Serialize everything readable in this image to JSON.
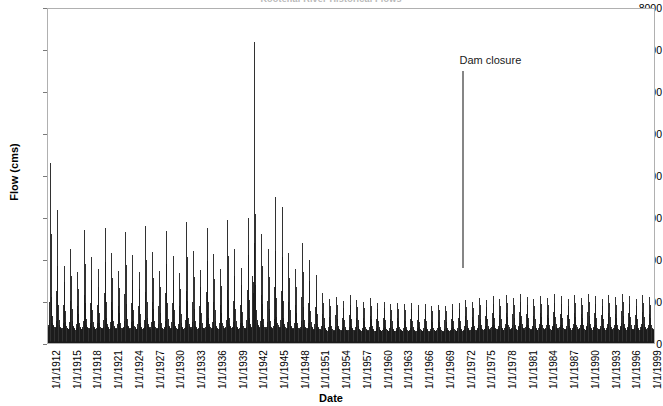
{
  "chart_data": {
    "type": "bar",
    "title": "Kootenai River Historical Flows",
    "xlabel": "Date",
    "ylabel": "Flow (cms)",
    "ylim": [
      0,
      8000
    ],
    "ytick_values": [
      0,
      1000,
      2000,
      3000,
      4000,
      5000,
      6000,
      7000,
      8000
    ],
    "ytick_labels": [
      "0",
      "1000",
      "2000",
      "3000",
      "4000",
      "5000",
      "6000",
      "7000",
      "8000"
    ],
    "grid": false,
    "legend": false,
    "xtick_labels": [
      "1/1/1912",
      "1/1/1915",
      "1/1/1918",
      "1/1/1921",
      "1/1/1924",
      "1/1/1927",
      "1/1/1930",
      "1/1/1933",
      "1/1/1936",
      "1/1/1939",
      "1/1/1942",
      "1/1/1945",
      "1/1/1948",
      "1/1/1951",
      "1/1/1954",
      "1/1/1957",
      "1/1/1960",
      "1/1/1963",
      "1/1/1966",
      "1/1/1969",
      "1/1/1972",
      "1/1/1975",
      "1/1/1978",
      "1/1/1981",
      "1/1/1984",
      "1/1/1987",
      "1/1/1990",
      "1/1/1993",
      "1/1/1996",
      "1/1/1999"
    ],
    "x_start_year": 1912,
    "x_end_year": 2000,
    "series_name": "Flow",
    "series_color": "#1a1a1a",
    "annotations": [
      {
        "name": "dam-closure",
        "text": "Dam closure",
        "year": 1972.0,
        "value_top": 6500,
        "value_bottom": 1800,
        "color": "#868686"
      }
    ],
    "monthly_values": [
      380,
      420,
      560,
      980,
      4300,
      2600,
      1100,
      640,
      470,
      420,
      400,
      380,
      350,
      380,
      520,
      1250,
      3180,
      1850,
      900,
      560,
      430,
      390,
      370,
      350,
      330,
      360,
      480,
      900,
      1850,
      1450,
      760,
      500,
      400,
      370,
      350,
      340,
      340,
      370,
      500,
      1000,
      2250,
      1600,
      820,
      520,
      410,
      380,
      360,
      345,
      320,
      350,
      460,
      880,
      1700,
      1300,
      700,
      470,
      390,
      360,
      345,
      330,
      345,
      375,
      520,
      1150,
      2700,
      1900,
      950,
      580,
      440,
      395,
      370,
      355,
      335,
      365,
      490,
      950,
      2050,
      1500,
      780,
      510,
      405,
      375,
      355,
      340,
      330,
      355,
      470,
      900,
      1780,
      1350,
      720,
      480,
      395,
      365,
      350,
      335,
      350,
      380,
      540,
      1200,
      2750,
      1950,
      980,
      590,
      445,
      400,
      375,
      360,
      340,
      370,
      500,
      980,
      2150,
      1550,
      800,
      520,
      410,
      380,
      358,
      342,
      325,
      352,
      465,
      890,
      1720,
      1320,
      710,
      475,
      392,
      362,
      348,
      332,
      348,
      378,
      530,
      1180,
      2650,
      1880,
      940,
      575,
      438,
      396,
      372,
      356,
      338,
      368,
      495,
      960,
      2100,
      1520,
      790,
      515,
      408,
      378,
      356,
      340,
      328,
      350,
      462,
      885,
      1690,
      1300,
      705,
      472,
      390,
      360,
      346,
      330,
      352,
      382,
      545,
      1220,
      2800,
      2000,
      990,
      595,
      448,
      402,
      377,
      361,
      342,
      372,
      502,
      985,
      2170,
      1560,
      805,
      522,
      412,
      381,
      359,
      343,
      326,
      353,
      467,
      892,
      1735,
      1330,
      715,
      477,
      393,
      363,
      349,
      333,
      350,
      380,
      535,
      1190,
      2680,
      1900,
      950,
      580,
      440,
      398,
      374,
      358,
      336,
      366,
      492,
      955,
      2080,
      1510,
      785,
      512,
      406,
      376,
      354,
      338,
      324,
      348,
      458,
      880,
      1670,
      1290,
      700,
      470,
      388,
      358,
      344,
      328,
      355,
      385,
      550,
      1240,
      2900,
      2050,
      1010,
      600,
      452,
      405,
      380,
      363,
      345,
      375,
      505,
      990,
      2200,
      1580,
      815,
      526,
      415,
      383,
      361,
      345,
      327,
      354,
      470,
      895,
      1750,
      1340,
      720,
      480,
      395,
      365,
      350,
      334,
      352,
      383,
      542,
      1210,
      2760,
      1960,
      975,
      588,
      444,
      400,
      376,
      360,
      340,
      370,
      498,
      975,
      2130,
      1540,
      798,
      518,
      410,
      380,
      357,
      341,
      330,
      356,
      472,
      900,
      1780,
      1360,
      728,
      484,
      397,
      367,
      352,
      336,
      358,
      388,
      558,
      1260,
      2950,
      2080,
      1020,
      605,
      455,
      408,
      382,
      365,
      348,
      378,
      508,
      995,
      2250,
      1600,
      820,
      530,
      418,
      386,
      363,
      347,
      332,
      358,
      475,
      905,
      1800,
      1380,
      735,
      488,
      400,
      370,
      354,
      338,
      360,
      390,
      562,
      1280,
      3000,
      2100,
      1030,
      610,
      458,
      410,
      385,
      368,
      1600,
      1450,
      1200,
      2400,
      7200,
      3100,
      1400,
      800,
      560,
      480,
      430,
      400,
      350,
      380,
      520,
      1150,
      2600,
      1850,
      930,
      570,
      435,
      395,
      372,
      356,
      345,
      375,
      505,
      1000,
      2250,
      1580,
      810,
      525,
      414,
      384,
      360,
      344,
      368,
      398,
      580,
      1350,
      3500,
      2200,
      1080,
      630,
      470,
      420,
      392,
      375,
      355,
      385,
      545,
      1250,
      3250,
      2050,
      1000,
      600,
      450,
      405,
      378,
      362,
      340,
      370,
      500,
      980,
      2150,
      1560,
      800,
      520,
      412,
      382,
      358,
      342,
      330,
      355,
      470,
      900,
      1780,
      1350,
      720,
      480,
      398,
      368,
      352,
      336,
      345,
      378,
      520,
      1100,
      2400,
      1700,
      860,
      545,
      425,
      390,
      368,
      350,
      335,
      365,
      490,
      950,
      2000,
      1480,
      775,
      505,
      403,
      373,
      352,
      337,
      320,
      345,
      450,
      860,
      1620,
      1260,
      690,
      465,
      385,
      355,
      342,
      326,
      300,
      320,
      400,
      700,
      1200,
      950,
      600,
      420,
      360,
      335,
      318,
      305,
      290,
      310,
      380,
      620,
      1050,
      880,
      560,
      400,
      345,
      325,
      310,
      298,
      295,
      315,
      390,
      660,
      1100,
      900,
      575,
      410,
      352,
      330,
      315,
      300,
      285,
      305,
      370,
      600,
      1000,
      850,
      545,
      395,
      340,
      320,
      306,
      294,
      300,
      320,
      395,
      680,
      1150,
      920,
      580,
      415,
      350,
      328,
      312,
      300,
      288,
      308,
      375,
      610,
      1020,
      860,
      550,
      398,
      342,
      322,
      308,
      296,
      282,
      300,
      365,
      590,
      980,
      830,
      538,
      390,
      336,
      316,
      303,
      291,
      296,
      316,
      388,
      650,
      1080,
      890,
      568,
      406,
      347,
      326,
      311,
      298,
      280,
      298,
      360,
      580,
      960,
      815,
      530,
      385,
      333,
      313,
      300,
      288,
      286,
      304,
      370,
      598,
      990,
      838,
      542,
      393,
      338,
      318,
      305,
      292,
      278,
      296,
      356,
      570,
      940,
      800,
      524,
      381,
      330,
      310,
      297,
      285,
      290,
      308,
      362,
      588,
      965,
      820,
      532,
      387,
      334,
      314,
      301,
      289,
      276,
      294,
      352,
      562,
      925,
      790,
      518,
      378,
      328,
      308,
      295,
      283,
      288,
      305,
      358,
      578,
      950,
      805,
      526,
      383,
      331,
      311,
      298,
      286,
      274,
      292,
      348,
      556,
      910,
      780,
      512,
      375,
      325,
      306,
      293,
      281,
      285,
      302,
      354,
      570,
      935,
      795,
      520,
      379,
      328,
      308,
      295,
      283,
      272,
      290,
      345,
      548,
      895,
      770,
      506,
      371,
      322,
      303,
      290,
      279,
      283,
      300,
      350,
      562,
      920,
      785,
      514,
      376,
      325,
      305,
      292,
      280,
      270,
      288,
      342,
      540,
      880,
      760,
      500,
      368,
      320,
      301,
      288,
      277,
      286,
      303,
      355,
      572,
      930,
      790,
      518,
      378,
      327,
      307,
      294,
      282,
      296,
      312,
      365,
      590,
      960,
      810,
      530,
      386,
      333,
      312,
      299,
      287,
      320,
      340,
      400,
      640,
      1020,
      860,
      560,
      405,
      348,
      325,
      310,
      298,
      310,
      330,
      388,
      615,
      990,
      838,
      545,
      396,
      342,
      320,
      306,
      294,
      340,
      360,
      425,
      680,
      1080,
      900,
      585,
      420,
      358,
      334,
      318,
      305,
      325,
      345,
      405,
      650,
      1040,
      870,
      566,
      408,
      350,
      327,
      312,
      300,
      355,
      375,
      440,
      710,
      1120,
      930,
      605,
      432,
      366,
      340,
      324,
      310,
      336,
      356,
      418,
      668,
      1060,
      888,
      578,
      416,
      355,
      331,
      316,
      303,
      368,
      388,
      455,
      730,
      1150,
      955,
      622,
      442,
      374,
      346,
      330,
      316,
      345,
      365,
      428,
      686,
      1085,
      905,
      590,
      423,
      360,
      335,
      320,
      306,
      380,
      400,
      470,
      752,
      1180,
      980,
      638,
      452,
      382,
      352,
      335,
      320,
      352,
      372,
      435,
      698,
      1105,
      920,
      600,
      430,
      365,
      339,
      323,
      309,
      330,
      350,
      410,
      655,
      1045,
      875,
      570,
      412,
      352,
      328,
      313,
      301,
      362,
      382,
      448,
      718,
      1135,
      942,
      612,
      437,
      370,
      343,
      327,
      313,
      344,
      364,
      426,
      682,
      1078,
      900,
      588,
      421,
      358,
      333,
      318,
      305,
      376,
      396,
      462,
      742,
      1168,
      968,
      630,
      447,
      378,
      349,
      332,
      318,
      356,
      376,
      440,
      706,
      1118,
      930,
      606,
      433,
      367,
      341,
      325,
      311,
      335,
      355,
      415,
      663,
      1055,
      882,
      576,
      415,
      354,
      330,
      315,
      302,
      368,
      388,
      452,
      724,
      1142,
      948,
      618,
      440,
      372,
      345,
      329,
      315,
      348,
      368,
      430,
      690,
      1088,
      908,
      594,
      426,
      361,
      336,
      321,
      307,
      380,
      400,
      468,
      748,
      1175,
      975,
      635,
      450,
      380,
      351,
      334,
      320,
      358,
      378,
      442,
      710,
      1125,
      935,
      610,
      436,
      369,
      343,
      327,
      313,
      338,
      358,
      418,
      668,
      1060,
      888,
      580,
      418,
      356,
      332,
      317,
      304,
      370,
      390,
      456,
      730,
      1150,
      955,
      622,
      443,
      374,
      347,
      331,
      317,
      350,
      370,
      432,
      695,
      1095,
      912,
      597,
      428,
      363,
      338,
      322,
      308,
      382,
      402,
      472,
      755,
      1185,
      982,
      640,
      454,
      383,
      354,
      337,
      322,
      360,
      380,
      445,
      714,
      1130,
      940,
      614,
      438,
      371,
      345,
      329,
      315,
      340,
      360,
      420,
      672,
      1065,
      892,
      583,
      420,
      358,
      334,
      319,
      306,
      372,
      392,
      458,
      734,
      1155,
      960,
      625,
      445,
      376,
      348,
      332,
      318,
      352,
      372,
      434,
      698,
      1100,
      916,
      600,
      430,
      365,
      340,
      324,
      310
    ]
  }
}
